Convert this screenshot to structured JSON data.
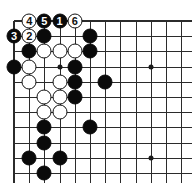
{
  "figure": {
    "kind": "go-board-diagram",
    "width": 192,
    "height": 183,
    "background_color": "#ffffff"
  },
  "board": {
    "line_color": "#2b2b2b",
    "black_stone_color": "#0a0a0a",
    "white_stone_color": "#ffffff",
    "white_stone_border_color": "#111111",
    "label_on_black_color": "#ffffff",
    "label_on_white_color": "#111111",
    "origin_x": 14,
    "origin_y": 21,
    "cell_size": 15.2,
    "columns": 12,
    "rows": 11,
    "stone_diameter": 15,
    "star_points": [
      {
        "col": 3,
        "row": 3
      },
      {
        "col": 9,
        "row": 3
      },
      {
        "col": 9,
        "row": 9
      }
    ]
  },
  "stones": [
    {
      "col": 1,
      "row": 0,
      "color": "white",
      "label": "4"
    },
    {
      "col": 2,
      "row": 0,
      "color": "black",
      "label": "5"
    },
    {
      "col": 3,
      "row": 0,
      "color": "black",
      "label": "1"
    },
    {
      "col": 4,
      "row": 0,
      "color": "white",
      "label": "6"
    },
    {
      "col": 0,
      "row": 1,
      "color": "black",
      "label": "3"
    },
    {
      "col": 1,
      "row": 1,
      "color": "white",
      "label": "2"
    },
    {
      "col": 2,
      "row": 1,
      "color": "black",
      "label": ""
    },
    {
      "col": 5,
      "row": 1,
      "color": "black",
      "label": ""
    },
    {
      "col": 1,
      "row": 2,
      "color": "black",
      "label": ""
    },
    {
      "col": 2,
      "row": 2,
      "color": "white",
      "label": ""
    },
    {
      "col": 3,
      "row": 2,
      "color": "white",
      "label": ""
    },
    {
      "col": 4,
      "row": 2,
      "color": "white",
      "label": ""
    },
    {
      "col": 5,
      "row": 2,
      "color": "black",
      "label": ""
    },
    {
      "col": 0,
      "row": 3,
      "color": "black",
      "label": ""
    },
    {
      "col": 1,
      "row": 3,
      "color": "white",
      "label": ""
    },
    {
      "col": 4,
      "row": 3,
      "color": "black",
      "label": ""
    },
    {
      "col": 1,
      "row": 4,
      "color": "white",
      "label": ""
    },
    {
      "col": 3,
      "row": 4,
      "color": "white",
      "label": ""
    },
    {
      "col": 4,
      "row": 4,
      "color": "black",
      "label": ""
    },
    {
      "col": 6,
      "row": 4,
      "color": "black",
      "label": ""
    },
    {
      "col": 2,
      "row": 5,
      "color": "white",
      "label": ""
    },
    {
      "col": 3,
      "row": 5,
      "color": "white",
      "label": ""
    },
    {
      "col": 4,
      "row": 5,
      "color": "black",
      "label": ""
    },
    {
      "col": 2,
      "row": 6,
      "color": "white",
      "label": ""
    },
    {
      "col": 3,
      "row": 6,
      "color": "white",
      "label": ""
    },
    {
      "col": 2,
      "row": 7,
      "color": "black",
      "label": ""
    },
    {
      "col": 5,
      "row": 7,
      "color": "black",
      "label": ""
    },
    {
      "col": 2,
      "row": 8,
      "color": "black",
      "label": ""
    },
    {
      "col": 1,
      "row": 9,
      "color": "black",
      "label": ""
    },
    {
      "col": 3,
      "row": 9,
      "color": "black",
      "label": ""
    },
    {
      "col": 2,
      "row": 10,
      "color": "black",
      "label": ""
    }
  ],
  "move_sequence": [
    {
      "number": "1",
      "color": "black"
    },
    {
      "number": "2",
      "color": "white"
    },
    {
      "number": "3",
      "color": "black"
    },
    {
      "number": "4",
      "color": "white"
    },
    {
      "number": "5",
      "color": "black"
    },
    {
      "number": "6",
      "color": "white"
    }
  ]
}
